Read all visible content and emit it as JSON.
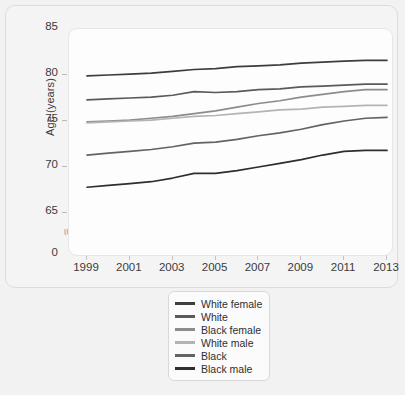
{
  "chart_data": {
    "type": "line",
    "title": "",
    "xlabel": "",
    "ylabel": "Age (years)",
    "x": [
      1999,
      2000,
      2001,
      2002,
      2003,
      2004,
      2005,
      2006,
      2007,
      2008,
      2009,
      2010,
      2011,
      2012,
      2013
    ],
    "xlim": [
      1999,
      2013
    ],
    "ylim": [
      63.5,
      85
    ],
    "xticks": [
      "1999",
      "2001",
      "2003",
      "2005",
      "2007",
      "2009",
      "2011",
      "2013"
    ],
    "yticks": [
      "85",
      "80",
      "75",
      "70",
      "65",
      "0"
    ],
    "grid": false,
    "axis_break": true,
    "legend_position": "below-center",
    "series": [
      {
        "name": "White female",
        "color": "#3d3d3d",
        "values": [
          79.9,
          80.0,
          80.1,
          80.2,
          80.4,
          80.6,
          80.7,
          80.9,
          81.0,
          81.1,
          81.3,
          81.4,
          81.5,
          81.6,
          81.6
        ]
      },
      {
        "name": "White",
        "color": "#5a5a5a",
        "values": [
          77.3,
          77.4,
          77.5,
          77.6,
          77.8,
          78.2,
          78.1,
          78.2,
          78.4,
          78.5,
          78.7,
          78.8,
          78.9,
          79.0,
          79.0
        ]
      },
      {
        "name": "Black female",
        "color": "#8c8c8c",
        "values": [
          74.9,
          75.0,
          75.1,
          75.3,
          75.5,
          75.8,
          76.1,
          76.5,
          76.9,
          77.2,
          77.6,
          77.9,
          78.2,
          78.4,
          78.4
        ]
      },
      {
        "name": "White male",
        "color": "#b4b4b4",
        "values": [
          74.8,
          74.9,
          75.0,
          75.1,
          75.3,
          75.5,
          75.6,
          75.8,
          76.0,
          76.2,
          76.3,
          76.5,
          76.6,
          76.7,
          76.7
        ]
      },
      {
        "name": "Black",
        "color": "#636363",
        "values": [
          71.3,
          71.5,
          71.7,
          71.9,
          72.2,
          72.6,
          72.7,
          73.0,
          73.4,
          73.7,
          74.1,
          74.6,
          75.0,
          75.3,
          75.4
        ]
      },
      {
        "name": "Black male",
        "color": "#2e2e2e",
        "values": [
          67.8,
          68.0,
          68.2,
          68.4,
          68.8,
          69.3,
          69.3,
          69.6,
          70.0,
          70.4,
          70.8,
          71.3,
          71.7,
          71.8,
          71.8
        ]
      }
    ]
  },
  "legend": {
    "items": [
      {
        "label": "White female"
      },
      {
        "label": "White"
      },
      {
        "label": "Black female"
      },
      {
        "label": "White male"
      },
      {
        "label": "Black"
      },
      {
        "label": "Black male"
      }
    ]
  },
  "axis_break_glyph": "≈"
}
